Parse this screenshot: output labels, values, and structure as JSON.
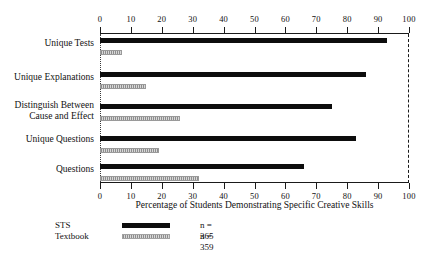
{
  "chart_data": {
    "type": "bar",
    "orientation": "horizontal",
    "title": "",
    "xlabel": "Percentage of Students Demonstrating Specific Creative Skills",
    "ylabel": "",
    "xlim": [
      0,
      100
    ],
    "xticks": [
      0,
      10,
      20,
      30,
      40,
      50,
      60,
      70,
      80,
      90,
      100
    ],
    "xtick_labels": [
      "0",
      "10",
      "20",
      "30",
      "40",
      "50",
      "60",
      "70",
      "80",
      "90",
      "100"
    ],
    "grid": false,
    "axis_top": true,
    "axis_bottom": true,
    "legend_position": "below-left",
    "categories": [
      "Unique Tests",
      "Unique Explanations",
      "Distinguish Between Cause and Effect",
      "Unique Questions",
      "Questions"
    ],
    "category_lines": [
      [
        "Unique Tests"
      ],
      [
        "Unique Explanations"
      ],
      [
        "Distinguish Between",
        "Cause and Effect"
      ],
      [
        "Unique Questions"
      ],
      [
        "Questions"
      ]
    ],
    "series": [
      {
        "name": "STS",
        "color": "#0d0d0d",
        "n_label": "n = 365",
        "values": [
          93,
          86,
          75,
          83,
          66
        ]
      },
      {
        "name": "Textbook",
        "color": "#bdbdbd",
        "n_label": "n = 359",
        "values": [
          7,
          15,
          26,
          19,
          32
        ]
      }
    ]
  },
  "legend": {
    "rows": [
      {
        "label": "STS",
        "n": "n = 365"
      },
      {
        "label": "Textbook",
        "n": "n = 359"
      }
    ]
  }
}
